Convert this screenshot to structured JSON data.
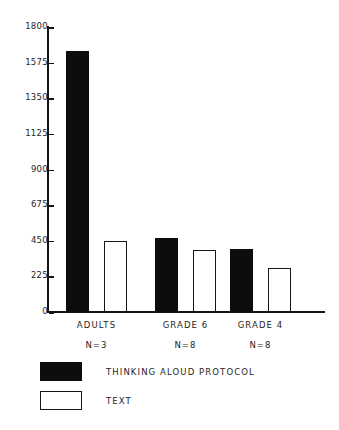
{
  "chart_data": {
    "type": "bar",
    "title": "",
    "subtitle": "",
    "xlabel": "",
    "ylabel": "",
    "ylim": [
      0,
      1800
    ],
    "yticks": [
      0,
      225,
      450,
      675,
      900,
      1125,
      1350,
      1575,
      1800
    ],
    "ytick_labels": [
      "0",
      "225",
      "450",
      "675",
      "900",
      "1125",
      "1350",
      "1575",
      "1800"
    ],
    "grid": false,
    "legend_position": "bottom-left",
    "categories": [
      "ADULTS",
      "GRADE 6",
      "GRADE 4"
    ],
    "category_sublabels": [
      "N=3",
      "N=8",
      "N=8"
    ],
    "series": [
      {
        "name": "THINKING ALOUD PROTOCOL",
        "color": "#0d0d0d",
        "fill": "solid",
        "values": [
          1650,
          465,
          400
        ]
      },
      {
        "name": "TEXT",
        "color": "#ffffff",
        "fill": "hollow",
        "values": [
          450,
          390,
          280
        ]
      }
    ]
  },
  "legend": {
    "entries": [
      {
        "label": "THINKING ALOUD PROTOCOL",
        "style": "filled"
      },
      {
        "label": "TEXT",
        "style": "hollow"
      }
    ]
  },
  "colors": {
    "axis": "#141414",
    "text": "#1e1e1e",
    "bar_solid": "#0d0d0d",
    "bar_hollow_fill": "#ffffff",
    "bar_hollow_stroke": "#161616",
    "background": "#ffffff"
  }
}
